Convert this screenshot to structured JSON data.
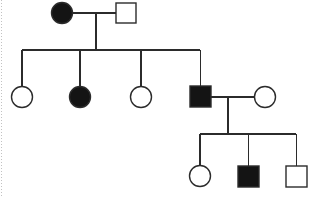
{
  "diagram": {
    "type": "pedigree",
    "background_color": "#ffffff",
    "line_color": "#2b2b2b",
    "affected_fill": "#141414",
    "unaffected_fill": "#ffffff",
    "legend": {
      "circle_meaning": "female",
      "square_meaning": "male",
      "filled_meaning": "affected",
      "open_meaning": "unaffected"
    },
    "generations": [
      {
        "id": "generation-1",
        "label": "I",
        "individuals": [
          {
            "id": "I-1",
            "shape": "circle",
            "sex": "female",
            "status": "affected",
            "cx": 62,
            "cy": 13,
            "r": 10.5
          },
          {
            "id": "I-2",
            "shape": "square",
            "sex": "male",
            "status": "unaffected",
            "x": 116,
            "y": 3,
            "size": 20
          }
        ]
      },
      {
        "id": "generation-2",
        "label": "II",
        "individuals": [
          {
            "id": "II-1",
            "shape": "circle",
            "sex": "female",
            "status": "unaffected",
            "cx": 22,
            "cy": 97,
            "r": 10.5
          },
          {
            "id": "II-2",
            "shape": "circle",
            "sex": "female",
            "status": "affected",
            "cx": 80,
            "cy": 97,
            "r": 10.5
          },
          {
            "id": "II-3",
            "shape": "circle",
            "sex": "female",
            "status": "unaffected",
            "cx": 141,
            "cy": 97,
            "r": 10.5
          },
          {
            "id": "II-4",
            "shape": "square",
            "sex": "male",
            "status": "affected",
            "x": 190,
            "y": 86,
            "size": 21
          },
          {
            "id": "II-5",
            "shape": "circle",
            "sex": "female",
            "status": "unaffected",
            "cx": 265,
            "cy": 97,
            "r": 10.5
          }
        ]
      },
      {
        "id": "generation-3",
        "label": "III",
        "individuals": [
          {
            "id": "III-1",
            "shape": "circle",
            "sex": "female",
            "status": "unaffected",
            "cx": 200,
            "cy": 176,
            "r": 10.5
          },
          {
            "id": "III-2",
            "shape": "square",
            "sex": "male",
            "status": "affected",
            "x": 238,
            "y": 166,
            "size": 21
          },
          {
            "id": "III-3",
            "shape": "square",
            "sex": "male",
            "status": "unaffected",
            "x": 286,
            "y": 166,
            "size": 21
          }
        ]
      }
    ],
    "unions": [
      {
        "id": "union-1",
        "partners": [
          "I-1",
          "I-2"
        ],
        "mating_line_y": 13,
        "mating_line_x1": 72,
        "mating_line_x2": 116,
        "descent_x": 96,
        "sibship_y": 50,
        "sibship_x1": 22,
        "sibship_x2": 200,
        "children": [
          "II-1",
          "II-2",
          "II-3",
          "II-4"
        ]
      },
      {
        "id": "union-2",
        "partners": [
          "II-4",
          "II-5"
        ],
        "mating_line_y": 97,
        "mating_line_x1": 211,
        "mating_line_x2": 255,
        "descent_x": 228,
        "sibship_y": 134,
        "sibship_x1": 200,
        "sibship_x2": 296,
        "children": [
          "III-1",
          "III-2",
          "III-3"
        ]
      }
    ],
    "counts": {
      "total_individuals": 10,
      "affected": 4,
      "unaffected": 6,
      "generations": 3
    }
  }
}
